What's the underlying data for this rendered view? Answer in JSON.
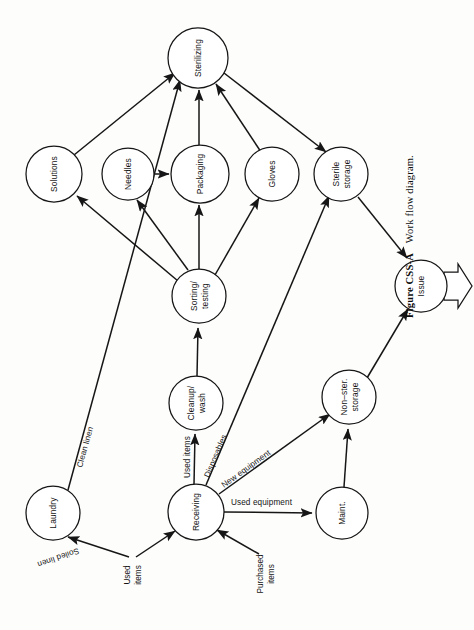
{
  "figure": {
    "number_label": "Figure CSS-A",
    "caption_text": "Work flow diagram.",
    "orientation": "rotated-90-ccw"
  },
  "diagram": {
    "type": "workflow-flow-diagram",
    "nodes": [
      {
        "id": "sterilizing",
        "label": "Sterilizing",
        "lines": [
          "Sterilizing"
        ],
        "x": 198,
        "y": 58,
        "r": 30
      },
      {
        "id": "solutions",
        "label": "Solutions",
        "lines": [
          "Solutions"
        ],
        "x": 54,
        "y": 174,
        "r": 28
      },
      {
        "id": "needles",
        "label": "Needles",
        "lines": [
          "Needles"
        ],
        "x": 128,
        "y": 174,
        "r": 26
      },
      {
        "id": "packaging",
        "label": "Packaging",
        "lines": [
          "Packaging"
        ],
        "x": 200,
        "y": 174,
        "r": 29
      },
      {
        "id": "gloves",
        "label": "Gloves",
        "lines": [
          "Gloves"
        ],
        "x": 272,
        "y": 174,
        "r": 27
      },
      {
        "id": "sterile_storage",
        "label": "Sterile storage",
        "lines": [
          "Sterile",
          "storage"
        ],
        "x": 341,
        "y": 174,
        "r": 27
      },
      {
        "id": "sorting_testing",
        "label": "Sorting/ testing",
        "lines": [
          "Sorting/",
          "testing"
        ],
        "x": 199,
        "y": 296,
        "r": 27
      },
      {
        "id": "issue",
        "label": "Issue",
        "lines": [
          "Issue"
        ],
        "x": 421,
        "y": 286,
        "r": 26
      },
      {
        "id": "cleanup_wash",
        "label": "Cleanup/ wash",
        "lines": [
          "Cleanup/",
          "wash"
        ],
        "x": 196,
        "y": 403,
        "r": 27
      },
      {
        "id": "non_ster_storage",
        "label": "Non–ster. storage",
        "lines": [
          "Non–ster.",
          "storage"
        ],
        "x": 349,
        "y": 397,
        "r": 27
      },
      {
        "id": "laundry",
        "label": "Laundry",
        "lines": [
          "Laundry"
        ],
        "x": 53,
        "y": 513,
        "r": 27
      },
      {
        "id": "receiving",
        "label": "Receiving",
        "lines": [
          "Receiving"
        ],
        "x": 196,
        "y": 512,
        "r": 28
      },
      {
        "id": "maint",
        "label": "Maint.",
        "lines": [
          "Maint."
        ],
        "x": 342,
        "y": 513,
        "r": 26
      }
    ],
    "edges": [
      {
        "from": "solutions",
        "to": "sterilizing",
        "label": ""
      },
      {
        "from": "packaging",
        "to": "sterilizing",
        "label": ""
      },
      {
        "from": "gloves",
        "to": "sterilizing",
        "label": ""
      },
      {
        "from": "sterilizing",
        "to": "sterile_storage",
        "label": ""
      },
      {
        "from": "needles",
        "to": "packaging",
        "label": ""
      },
      {
        "from": "sorting_testing",
        "to": "solutions",
        "label": ""
      },
      {
        "from": "sorting_testing",
        "to": "needles",
        "label": ""
      },
      {
        "from": "sorting_testing",
        "to": "packaging",
        "label": ""
      },
      {
        "from": "sorting_testing",
        "to": "gloves",
        "label": ""
      },
      {
        "from": "cleanup_wash",
        "to": "sorting_testing",
        "label": ""
      },
      {
        "from": "laundry",
        "to": "sterilizing",
        "label": "Clean linen"
      },
      {
        "from": "receiving",
        "to": "cleanup_wash",
        "label": "Used items"
      },
      {
        "from": "receiving",
        "to": "sterile_storage",
        "label": "Disposables"
      },
      {
        "from": "receiving",
        "to": "non_ster_storage",
        "label": "New equipment"
      },
      {
        "from": "receiving",
        "to": "maint",
        "label": "Used equipment"
      },
      {
        "from": "maint",
        "to": "non_ster_storage",
        "label": ""
      },
      {
        "from": "sterile_storage",
        "to": "issue",
        "label": ""
      },
      {
        "from": "non_ster_storage",
        "to": "issue",
        "label": ""
      },
      {
        "from": "used_items_src",
        "to": "laundry",
        "label": "Soiled linen"
      },
      {
        "from": "used_items_src",
        "to": "receiving",
        "label": ""
      },
      {
        "from": "purchased_items_src",
        "to": "receiving",
        "label": ""
      }
    ],
    "edge_labels": {
      "clean_linen": "Clean linen",
      "soiled_linen": "Soiled linen",
      "used_items_edge": "Used items",
      "disposables": "Disposables",
      "new_equipment": "New equipment",
      "used_equipment": "Used equipment"
    },
    "external_sources": [
      {
        "id": "used_items_src",
        "lines": [
          "Used",
          "items"
        ],
        "x": 132,
        "y": 575
      },
      {
        "id": "purchased_items_src",
        "lines": [
          "Purchased",
          "items"
        ],
        "x": 265,
        "y": 574
      }
    ],
    "output_marker": {
      "id": "issue_out",
      "shape": "hollow-block-arrow",
      "from": "issue",
      "direction": "right"
    },
    "colors": {
      "stroke": "#161616",
      "node_fill": "#ffffff",
      "text": "#121212",
      "page_background": "#fdfdfc"
    }
  }
}
